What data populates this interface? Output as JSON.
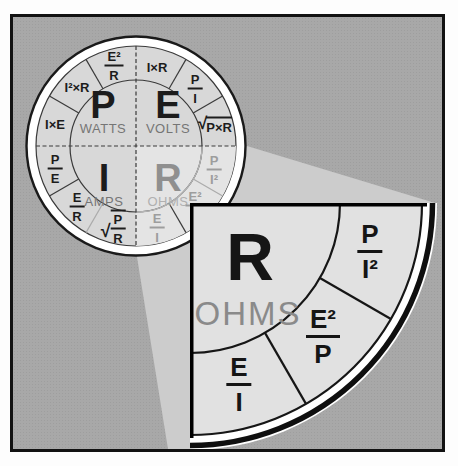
{
  "wheel": {
    "quadrants": {
      "watts": {
        "letter": "P",
        "label": "WATTS"
      },
      "volts": {
        "letter": "E",
        "label": "VOLTS"
      },
      "amps": {
        "letter": "I",
        "label": "AMPS"
      },
      "ohms": {
        "letter": "R",
        "label": "OHMS"
      }
    },
    "segments": [
      {
        "type": "inline",
        "text": "I×R"
      },
      {
        "type": "fraction",
        "num": "P",
        "den": "I"
      },
      {
        "type": "sqrt",
        "text": "P×R",
        "radical": "√"
      },
      {
        "type": "fraction",
        "num": "P",
        "den": "I²",
        "faded": true
      },
      {
        "type": "fraction",
        "num": "E²",
        "den": "P",
        "faded": true
      },
      {
        "type": "fraction",
        "num": "E",
        "den": "I",
        "faded": true
      },
      {
        "type": "sqrt-fraction",
        "num": "P",
        "den": "R",
        "radical": "√"
      },
      {
        "type": "fraction",
        "num": "E",
        "den": "R"
      },
      {
        "type": "fraction",
        "num": "P",
        "den": "E"
      },
      {
        "type": "inline",
        "text": "I×E"
      },
      {
        "type": "inline",
        "text": "I²×R"
      },
      {
        "type": "fraction",
        "num": "E²",
        "den": "R"
      }
    ]
  },
  "callout": {
    "letter": "R",
    "label": "OHMS",
    "formulas": [
      {
        "num": "P",
        "den": "I²"
      },
      {
        "num": "E²",
        "den": "P"
      },
      {
        "num": "E",
        "den": "I"
      }
    ]
  },
  "colors": {
    "background": "#a8a8a8",
    "beam": "#cccccc",
    "wheel_fill": "#d8d8d8",
    "faded_quadrant_fill": "#e4e4e4",
    "callout_fill": "#e1e1e1",
    "ink": "#1c1c1c",
    "muted_label": "#757575",
    "faded_text": "#9d9d9d",
    "white": "#ffffff"
  }
}
